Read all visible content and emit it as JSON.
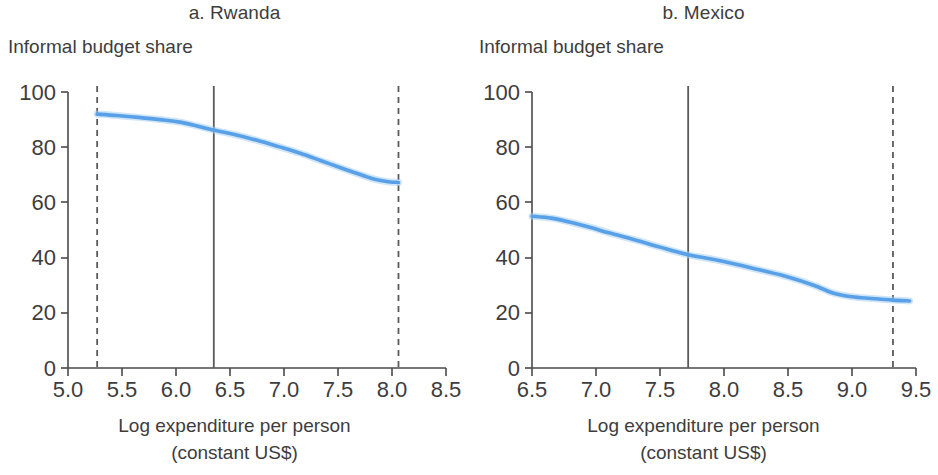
{
  "figure": {
    "background_color": "#ffffff",
    "series_color": "#58a0e8",
    "axis_color": "#4a4a4a",
    "reference_line_color": "#5a5a5a"
  },
  "panels": {
    "a": {
      "title": "a. Rwanda",
      "ylabel": "Informal budget share",
      "xlabel_line1": "Log expenditure per person",
      "xlabel_line2": "(constant US$)",
      "xticks": [
        "5.0",
        "5.5",
        "6.0",
        "6.5",
        "7.0",
        "7.5",
        "8.0",
        "8.5"
      ],
      "yticks": [
        "0",
        "20",
        "40",
        "60",
        "80",
        "100"
      ]
    },
    "b": {
      "title": "b. Mexico",
      "ylabel": "Informal budget share",
      "xlabel_line1": "Log expenditure per person",
      "xlabel_line2": "(constant US$)",
      "xticks": [
        "6.5",
        "7.0",
        "7.5",
        "8.0",
        "8.5",
        "9.0",
        "9.5"
      ],
      "yticks": [
        "0",
        "20",
        "40",
        "60",
        "80",
        "100"
      ]
    }
  },
  "chart_data": [
    {
      "type": "line",
      "panel": "a",
      "title": "a. Rwanda",
      "xlabel": "Log expenditure per person (constant US$)",
      "ylabel": "Informal budget share",
      "xlim": [
        5.0,
        8.5
      ],
      "ylim": [
        0,
        100
      ],
      "xticks": [
        5.0,
        5.5,
        6.0,
        6.5,
        7.0,
        7.5,
        8.0,
        8.5
      ],
      "yticks": [
        0,
        20,
        40,
        60,
        80,
        100
      ],
      "grid": false,
      "legend": "none",
      "series": [
        {
          "name": "Informal budget share",
          "color": "#58a0e8",
          "x": [
            5.27,
            5.45,
            5.65,
            5.85,
            6.05,
            6.35,
            6.55,
            6.75,
            6.95,
            7.15,
            7.35,
            7.55,
            7.75,
            7.85,
            7.95,
            8.06
          ],
          "y": [
            92.0,
            91.5,
            90.8,
            90.0,
            89.0,
            86.2,
            84.5,
            82.5,
            80.2,
            77.8,
            75.0,
            72.2,
            69.5,
            68.3,
            67.6,
            67.2
          ]
        }
      ],
      "reference_lines": [
        {
          "type": "dashed",
          "orientation": "vertical",
          "x": 5.27
        },
        {
          "type": "solid",
          "orientation": "vertical",
          "x": 6.35
        },
        {
          "type": "dashed",
          "orientation": "vertical",
          "x": 8.06
        }
      ]
    },
    {
      "type": "line",
      "panel": "b",
      "title": "b. Mexico",
      "xlabel": "Log expenditure per person (constant US$)",
      "ylabel": "Informal budget share",
      "xlim": [
        6.5,
        9.5
      ],
      "ylim": [
        0,
        100
      ],
      "xticks": [
        6.5,
        7.0,
        7.5,
        8.0,
        8.5,
        9.0,
        9.5
      ],
      "yticks": [
        0,
        20,
        40,
        60,
        80,
        100
      ],
      "grid": false,
      "legend": "none",
      "series": [
        {
          "name": "Informal budget share",
          "color": "#58a0e8",
          "x": [
            6.5,
            6.65,
            6.8,
            6.95,
            7.1,
            7.3,
            7.5,
            7.72,
            7.9,
            8.1,
            8.3,
            8.5,
            8.7,
            8.85,
            9.0,
            9.15,
            9.32,
            9.45
          ],
          "y": [
            55.0,
            54.3,
            52.8,
            51.0,
            49.0,
            46.5,
            43.8,
            41.0,
            39.5,
            37.5,
            35.3,
            33.0,
            30.0,
            27.2,
            25.8,
            25.2,
            24.6,
            24.3
          ]
        }
      ],
      "reference_lines": [
        {
          "type": "solid",
          "orientation": "vertical",
          "x": 7.72
        },
        {
          "type": "dashed",
          "orientation": "vertical",
          "x": 9.32
        }
      ]
    }
  ]
}
